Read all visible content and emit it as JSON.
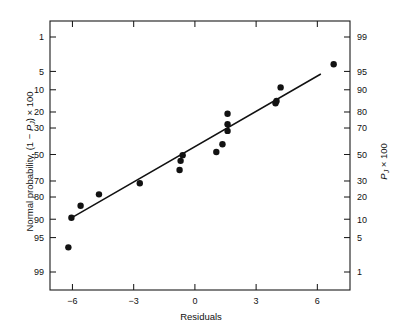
{
  "chart_data": {
    "type": "scatter",
    "title": "",
    "xlabel": "Residuals",
    "ylabel": "Normal probability, (1 − PJ) × 100",
    "ylabel_right": "PJ × 100",
    "grid": false,
    "legend": false,
    "xlim": [
      -7.1,
      7.6
    ],
    "xticks": [
      -6,
      -3,
      0,
      3,
      6
    ],
    "xtick_labels": [
      "−6",
      "−3",
      "0",
      "3",
      "6"
    ],
    "yscale": "normal-probability",
    "yticks_left": [
      1,
      5,
      10,
      20,
      30,
      50,
      70,
      80,
      90,
      95,
      99
    ],
    "ytick_labels_left": [
      "1",
      "5",
      "10",
      "20",
      "30",
      "50",
      "70",
      "80",
      "90",
      "95",
      "99"
    ],
    "yticks_right": [
      99,
      95,
      90,
      80,
      70,
      50,
      30,
      20,
      10,
      5,
      1
    ],
    "ytick_labels_right": [
      "99",
      "95",
      "90",
      "80",
      "70",
      "50",
      "30",
      "20",
      "10",
      "5",
      "1"
    ],
    "points": [
      {
        "x": -6.2,
        "y_left": 96.7,
        "y_right": 3.3
      },
      {
        "x": -6.05,
        "y_left": 89.5,
        "y_right": 10.5
      },
      {
        "x": -5.6,
        "y_left": 84.5,
        "y_right": 15.5
      },
      {
        "x": -4.7,
        "y_left": 78.5,
        "y_right": 21.5
      },
      {
        "x": -2.7,
        "y_left": 71.5,
        "y_right": 28.5
      },
      {
        "x": -0.7,
        "y_left": 55.0,
        "y_right": 45.0
      },
      {
        "x": -0.75,
        "y_left": 62.0,
        "y_right": 38.0
      },
      {
        "x": -0.6,
        "y_left": 50.5,
        "y_right": 49.5
      },
      {
        "x": 1.05,
        "y_left": 48.0,
        "y_right": 52.0
      },
      {
        "x": 1.35,
        "y_left": 42.0,
        "y_right": 58.0
      },
      {
        "x": 1.6,
        "y_left": 32.0,
        "y_right": 68.0
      },
      {
        "x": 1.6,
        "y_left": 27.5,
        "y_right": 72.5
      },
      {
        "x": 1.6,
        "y_left": 21.0,
        "y_right": 79.0
      },
      {
        "x": 4.0,
        "y_left": 14.5,
        "y_right": 85.5
      },
      {
        "x": 3.95,
        "y_left": 15.5,
        "y_right": 84.5
      },
      {
        "x": 4.2,
        "y_left": 9.2,
        "y_right": 90.8
      },
      {
        "x": 6.8,
        "y_left": 3.7,
        "y_right": 96.3
      }
    ],
    "fit_line": {
      "x_start": -6.05,
      "y_left_start": 89.5,
      "x_end": 6.15,
      "y_left_end": 5.6
    },
    "marker_size_px": 3.2,
    "line_color": "#111111",
    "point_color": "#121212",
    "frame_color": "#1a1a1a",
    "background": "#ffffff"
  }
}
